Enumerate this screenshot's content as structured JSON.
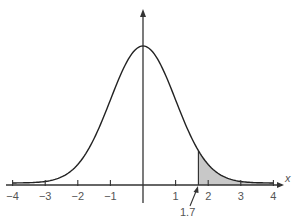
{
  "chart_data": {
    "type": "area",
    "title": "",
    "subtitle": "",
    "xlabel": "x",
    "ylabel": "",
    "xlim": [
      -4,
      4
    ],
    "ticks": [
      -4,
      -3,
      -2,
      -1,
      1,
      2,
      3,
      4
    ],
    "tick_labels": [
      "−4",
      "−3",
      "−2",
      "−1",
      "1",
      "2",
      "3",
      "4"
    ],
    "grid": false,
    "legend": null,
    "series": [
      {
        "name": "standard normal density",
        "distribution": "normal",
        "mean": 0,
        "sd": 1
      }
    ],
    "shaded_region": {
      "from": 1.7,
      "to": 4,
      "color": "#c8c8c8"
    },
    "annotations": [
      {
        "text": "1.7",
        "x": 1.7,
        "type": "arrow-label"
      }
    ]
  },
  "colors": {
    "curve": "#222222",
    "axis": "#333333",
    "shade": "#c8c8c8",
    "label": "#555555"
  }
}
